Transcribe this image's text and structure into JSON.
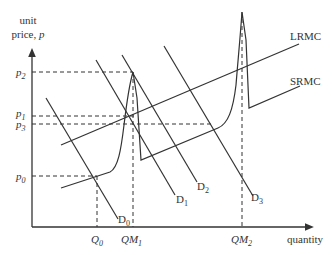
{
  "axes": {
    "y_label_line1": "unit",
    "y_label_line2": "price, ",
    "y_label_var": "p",
    "x_label": "quantity"
  },
  "price_ticks": [
    {
      "sym": "p",
      "sub": "2",
      "y": 72
    },
    {
      "sym": "p",
      "sub": "1",
      "y": 116
    },
    {
      "sym": "p",
      "sub": "3",
      "y": 124
    },
    {
      "sym": "p",
      "sub": "0",
      "y": 176
    }
  ],
  "quantity_ticks": [
    {
      "sym": "Q",
      "sub": "0",
      "x": 97
    },
    {
      "sym": "QM",
      "sub": "1",
      "x": 133
    },
    {
      "sym": "QM",
      "sub": "2",
      "x": 242
    }
  ],
  "curves": {
    "lrmc_label": "LRMC",
    "srmc_label": "SRMC"
  },
  "demand_labels": [
    {
      "sym": "D",
      "sub": "0"
    },
    {
      "sym": "D",
      "sub": "1"
    },
    {
      "sym": "D",
      "sub": "2"
    },
    {
      "sym": "D",
      "sub": "3"
    }
  ],
  "colors": {
    "line": "#333333",
    "background": "#ffffff"
  }
}
